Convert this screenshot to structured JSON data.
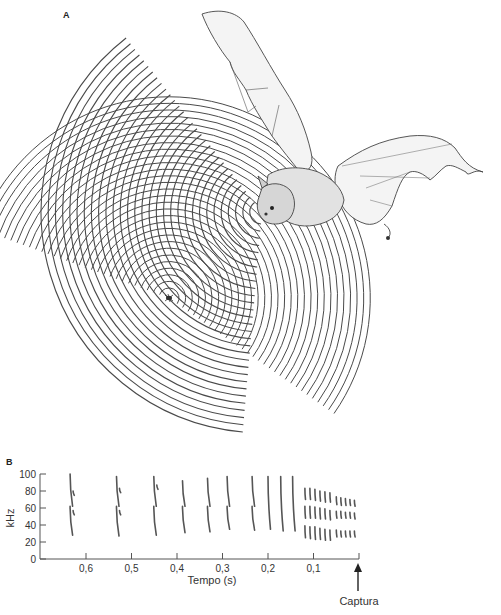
{
  "panels": {
    "a": {
      "label": "A",
      "description": "Bat emitting echolocation sound waves toward an insect; echoes returning from the insect"
    },
    "b": {
      "label": "B"
    }
  },
  "illustration": {
    "subject": "bat-in-flight",
    "prey": "insect",
    "emitted_wave_count": 30,
    "echo_wave_count": 30
  },
  "chart_data": {
    "type": "scatter",
    "subtype": "spectrogram-sketch",
    "title": "",
    "xlabel": "Tempo (s)",
    "ylabel": "kHz",
    "x_direction": "reversed",
    "xlim": [
      0.66,
      0.0
    ],
    "ylim": [
      0,
      100
    ],
    "yticks": [
      0,
      20,
      40,
      60,
      80,
      100
    ],
    "ytick_labels": [
      "0",
      "20",
      "40",
      "60",
      "80",
      "100"
    ],
    "xticks": [
      0.6,
      0.5,
      0.4,
      0.3,
      0.2,
      0.1,
      0.0
    ],
    "xtick_labels": [
      "0,6",
      "0,5",
      "0,4",
      "0,3",
      "0,2",
      "0,1",
      ""
    ],
    "annotation": {
      "text": "Captura",
      "x": 0.0,
      "arrow": "up"
    },
    "calls": [
      {
        "phase": "search",
        "t": 0.635,
        "segments": [
          [
            100,
            62
          ],
          [
            62,
            28
          ],
          [
            80,
            75
          ],
          [
            57,
            52
          ]
        ]
      },
      {
        "phase": "search",
        "t": 0.533,
        "segments": [
          [
            97,
            62
          ],
          [
            62,
            27
          ],
          [
            83,
            78
          ],
          [
            57,
            52
          ]
        ]
      },
      {
        "phase": "search",
        "t": 0.451,
        "segments": [
          [
            97,
            62
          ],
          [
            62,
            28
          ],
          [
            87,
            82
          ]
        ]
      },
      {
        "phase": "approach",
        "t": 0.388,
        "segments": [
          [
            92,
            62
          ],
          [
            62,
            31
          ]
        ]
      },
      {
        "phase": "approach",
        "t": 0.333,
        "segments": [
          [
            95,
            62
          ],
          [
            62,
            32
          ]
        ]
      },
      {
        "phase": "approach",
        "t": 0.29,
        "segments": [
          [
            97,
            62
          ],
          [
            62,
            35
          ]
        ]
      },
      {
        "phase": "approach",
        "t": 0.235,
        "segments": [
          [
            97,
            62
          ],
          [
            62,
            34
          ]
        ]
      },
      {
        "phase": "approach",
        "t": 0.2,
        "segments": [
          [
            97,
            35
          ]
        ]
      },
      {
        "phase": "approach",
        "t": 0.172,
        "segments": [
          [
            97,
            33
          ]
        ]
      },
      {
        "phase": "approach",
        "t": 0.146,
        "segments": [
          [
            97,
            33
          ]
        ]
      },
      {
        "phase": "terminal",
        "t": 0.119,
        "segments": [
          [
            83,
            70
          ],
          [
            62,
            48
          ],
          [
            39,
            25
          ]
        ]
      },
      {
        "phase": "terminal",
        "t": 0.108,
        "segments": [
          [
            83,
            70
          ],
          [
            62,
            48
          ],
          [
            38,
            24
          ]
        ]
      },
      {
        "phase": "terminal",
        "t": 0.097,
        "segments": [
          [
            82,
            69
          ],
          [
            61,
            48
          ],
          [
            38,
            23
          ]
        ]
      },
      {
        "phase": "terminal",
        "t": 0.086,
        "segments": [
          [
            80,
            68
          ],
          [
            60,
            47
          ],
          [
            36,
            23
          ]
        ]
      },
      {
        "phase": "terminal",
        "t": 0.075,
        "segments": [
          [
            79,
            67
          ],
          [
            59,
            47
          ],
          [
            35,
            22
          ]
        ]
      },
      {
        "phase": "terminal",
        "t": 0.064,
        "segments": [
          [
            78,
            67
          ],
          [
            57,
            46
          ],
          [
            34,
            22
          ]
        ]
      },
      {
        "phase": "terminal",
        "t": 0.05,
        "segments": [
          [
            73,
            64
          ],
          [
            56,
            48
          ],
          [
            34,
            26
          ]
        ]
      },
      {
        "phase": "terminal",
        "t": 0.04,
        "segments": [
          [
            72,
            63
          ],
          [
            56,
            48
          ],
          [
            33,
            26
          ]
        ]
      },
      {
        "phase": "terminal",
        "t": 0.03,
        "segments": [
          [
            71,
            63
          ],
          [
            55,
            48
          ],
          [
            33,
            26
          ]
        ]
      },
      {
        "phase": "terminal",
        "t": 0.02,
        "segments": [
          [
            70,
            63
          ],
          [
            55,
            48
          ],
          [
            33,
            26
          ]
        ]
      },
      {
        "phase": "terminal",
        "t": 0.01,
        "segments": [
          [
            69,
            62
          ],
          [
            54,
            47
          ],
          [
            33,
            26
          ]
        ]
      }
    ]
  },
  "colors": {
    "ink": "#555555",
    "wave": "#4a4a4a",
    "text": "#333333",
    "background": "#ffffff"
  }
}
